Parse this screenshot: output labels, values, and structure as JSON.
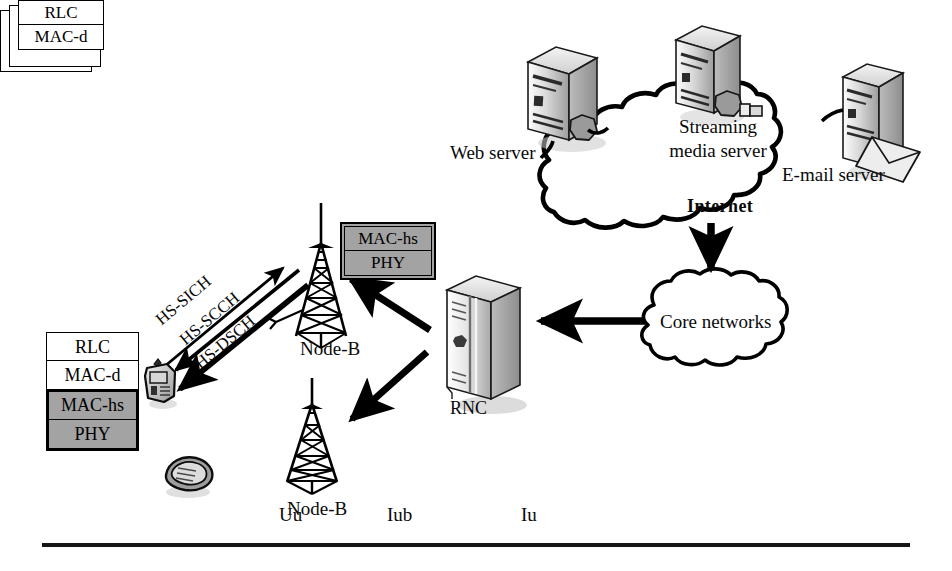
{
  "internet": {
    "cloud_label": "Internet",
    "servers": [
      {
        "id": "web",
        "label": "Web server",
        "icon": "server-tower-icon"
      },
      {
        "id": "streaming",
        "label1": "Streaming",
        "label2": "media server",
        "icon": "server-tower-icon"
      },
      {
        "id": "email",
        "label": "E-mail server",
        "icon": "mail-server-icon"
      }
    ]
  },
  "core": {
    "cloud_label": "Core networks"
  },
  "rnc": {
    "label": "RNC",
    "icon": "rnc-cabinet-icon",
    "stack": {
      "layers": [
        "RLC",
        "MAC-d"
      ],
      "deck_count": 3
    }
  },
  "nodeb": {
    "upper_label": "Node-B",
    "lower_label": "Node-B",
    "icon": "antenna-tower-icon",
    "stack": {
      "layers": [
        {
          "name": "MAC-hs",
          "shaded": true
        },
        {
          "name": "PHY",
          "shaded": true
        }
      ]
    }
  },
  "ue": {
    "phone_icon": "mobile-phone-icon",
    "flip_phone_icon": "flip-phone-icon",
    "stack": {
      "layers": [
        {
          "name": "RLC",
          "shaded": false
        },
        {
          "name": "MAC-d",
          "shaded": false
        },
        {
          "name": "MAC-hs",
          "shaded": true
        },
        {
          "name": "PHY",
          "shaded": true
        }
      ]
    }
  },
  "channels": [
    {
      "name": "HS-SICH",
      "direction": "uplink"
    },
    {
      "name": "HS-SCCH",
      "direction": "downlink"
    },
    {
      "name": "HS-DSCH",
      "direction": "downlink"
    }
  ],
  "interfaces": [
    {
      "name": "Uu"
    },
    {
      "name": "Iub"
    },
    {
      "name": "Iu"
    }
  ],
  "colors": {
    "line": "#000000",
    "shaded_layer": "#a3a3a3",
    "background": "#ffffff",
    "rule": "#161616"
  }
}
